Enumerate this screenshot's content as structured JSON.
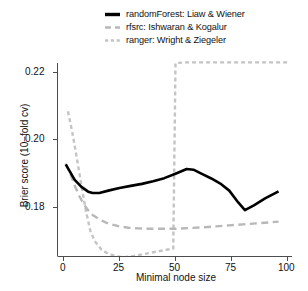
{
  "chart_data": {
    "type": "line",
    "title": "",
    "xlabel": "Minimal node size",
    "ylabel": "Brier score (10−fold cv)",
    "xlim": [
      0,
      100
    ],
    "ylim": [
      0.1635,
      0.2255
    ],
    "grid": false,
    "legend_position": "top",
    "xticks": [
      0,
      25,
      50,
      75,
      100
    ],
    "xtick_labels": [
      "0",
      "25",
      "50",
      "75",
      "100"
    ],
    "yticks": [
      0.18,
      0.2,
      0.22
    ],
    "ytick_labels": [
      "0.18",
      "0.20",
      "0.22"
    ],
    "series": [
      {
        "name": "randomForest: Liaw & Wiener",
        "color": "#000000",
        "style": "solid",
        "width": 2.6,
        "x": [
          1,
          3,
          5,
          8,
          11,
          13,
          16,
          20,
          25,
          30,
          35,
          40,
          45,
          50,
          55,
          58,
          62,
          66,
          70,
          74,
          78,
          81,
          85,
          90,
          96
        ],
        "y": [
          0.1928,
          0.1905,
          0.1882,
          0.1861,
          0.1847,
          0.1843,
          0.1843,
          0.185,
          0.1858,
          0.1864,
          0.187,
          0.1878,
          0.1887,
          0.19,
          0.1914,
          0.1912,
          0.1899,
          0.1886,
          0.1871,
          0.185,
          0.1815,
          0.1792,
          0.1806,
          0.1827,
          0.1848
        ]
      },
      {
        "name": "rfsrc: Ishwaran & Kogalur",
        "color": "#b8b8b8",
        "style": "dashed-long",
        "width": 2.4,
        "x": [
          1,
          3,
          5,
          7,
          9,
          11,
          13,
          16,
          19,
          22,
          25,
          29,
          33,
          38,
          44,
          50,
          56,
          62,
          68,
          74,
          80,
          86,
          92,
          96
        ],
        "y": [
          0.193,
          0.19,
          0.1865,
          0.1835,
          0.181,
          0.1792,
          0.1778,
          0.1765,
          0.1755,
          0.1749,
          0.1744,
          0.174,
          0.1738,
          0.1737,
          0.1737,
          0.1737,
          0.1739,
          0.1741,
          0.1744,
          0.1747,
          0.175,
          0.1753,
          0.1756,
          0.1758
        ]
      },
      {
        "name": "ranger: Wright & Ziegeler",
        "color": "#c4c4c4",
        "style": "dashed-short",
        "width": 2.4,
        "x": [
          2,
          4,
          6,
          8,
          10,
          12,
          14,
          17,
          20,
          24,
          27,
          31,
          35,
          39,
          43,
          46,
          48,
          49,
          49.4,
          50,
          55,
          62,
          70,
          78,
          86,
          94,
          100
        ],
        "y": [
          0.2085,
          0.202,
          0.1945,
          0.1865,
          0.179,
          0.173,
          0.17,
          0.1675,
          0.1663,
          0.1655,
          0.1653,
          0.1656,
          0.1661,
          0.1666,
          0.1671,
          0.1675,
          0.1677,
          0.1678,
          0.19,
          0.2228,
          0.223,
          0.223,
          0.223,
          0.223,
          0.223,
          0.223,
          0.223
        ]
      }
    ]
  },
  "legend": {
    "items": [
      {
        "label": "randomForest: Liaw & Wiener",
        "key": "solid-line-key"
      },
      {
        "label": "rfsrc: Ishwaran & Kogalur",
        "key": "long-dash-line-key"
      },
      {
        "label": "ranger: Wright & Ziegeler",
        "key": "short-dash-line-key"
      }
    ]
  },
  "axes": {
    "y_title": "Brier score (10−fold cv)",
    "x_title": "Minimal node size",
    "y_tick_labels": [
      "0.22",
      "0.20",
      "0.18"
    ],
    "x_tick_labels": [
      "0",
      "25",
      "50",
      "75",
      "100"
    ]
  },
  "colors": {
    "foreground": "#000000",
    "axis": "#4d4d4d",
    "rfsrc": "#b8b8b8",
    "ranger": "#c4c4c4",
    "background": "#ffffff"
  }
}
